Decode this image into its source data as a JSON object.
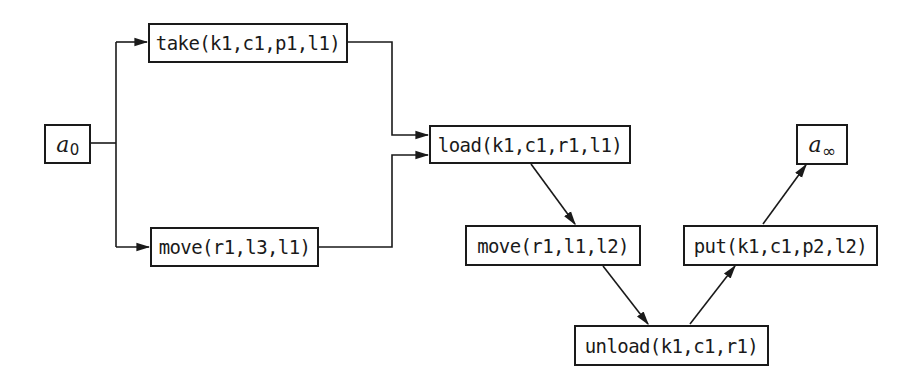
{
  "diagram": {
    "type": "plan-graph",
    "nodes": {
      "start": {
        "label": "a",
        "subscript": "0"
      },
      "take": {
        "label": "take(k1,c1,p1,l1)"
      },
      "move1": {
        "label": "move(r1,l3,l1)"
      },
      "load": {
        "label": "load(k1,c1,r1,l1)"
      },
      "move2": {
        "label": "move(r1,l1,l2)"
      },
      "unload": {
        "label": "unload(k1,c1,r1)"
      },
      "put": {
        "label": "put(k1,c1,p2,l2)"
      },
      "end": {
        "label": "a",
        "subscript": "∞"
      }
    },
    "edges": [
      {
        "from": "start",
        "to": "take"
      },
      {
        "from": "start",
        "to": "move1"
      },
      {
        "from": "take",
        "to": "load"
      },
      {
        "from": "move1",
        "to": "load"
      },
      {
        "from": "load",
        "to": "move2"
      },
      {
        "from": "move2",
        "to": "unload"
      },
      {
        "from": "unload",
        "to": "put"
      },
      {
        "from": "put",
        "to": "end"
      }
    ],
    "colors": {
      "stroke": "#1a1a1a",
      "background": "#ffffff"
    }
  }
}
